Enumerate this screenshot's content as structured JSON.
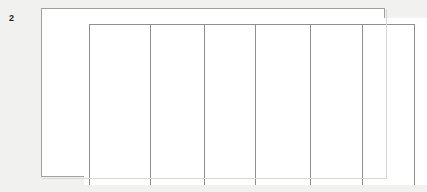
{
  "figure": {
    "number_label": "2",
    "caption": "",
    "type": "blank-ruled-table"
  },
  "colors": {
    "page_background": "#f1f1ef",
    "table_fill": "#ffffff",
    "outer_border": "#a0a09e",
    "rule_line": "#8f8f8f",
    "shadow": "#d8d8d6",
    "label_text": "#1d1d1d"
  },
  "table": {
    "header_row": {
      "labels": [
        "",
        "",
        "",
        "",
        "",
        ""
      ]
    },
    "columns": [
      {
        "index": 1,
        "header": "",
        "cells": []
      },
      {
        "index": 2,
        "header": "",
        "cells": []
      },
      {
        "index": 3,
        "header": "",
        "cells": []
      },
      {
        "index": 4,
        "header": "",
        "cells": []
      },
      {
        "index": 5,
        "header": "",
        "cells": []
      },
      {
        "index": 6,
        "header": "",
        "cells": []
      }
    ],
    "column_count": 6,
    "row_count": 0,
    "content_note": ""
  }
}
